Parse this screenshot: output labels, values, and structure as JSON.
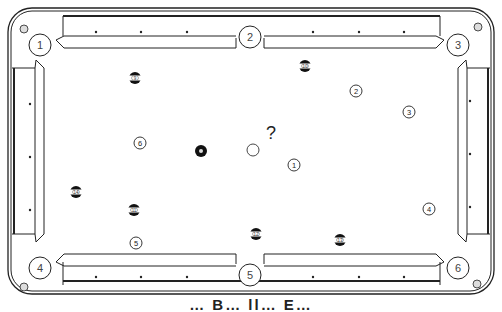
{
  "diagram": {
    "title_partial": "… B… ll… E…",
    "question_mark": "?",
    "pockets": [
      {
        "label": "1",
        "x": 40,
        "y": 45
      },
      {
        "label": "2",
        "x": 250,
        "y": 37
      },
      {
        "label": "3",
        "x": 458,
        "y": 45
      },
      {
        "label": "4",
        "x": 40,
        "y": 268
      },
      {
        "label": "5",
        "x": 250,
        "y": 275
      },
      {
        "label": "6",
        "x": 458,
        "y": 268
      }
    ],
    "solid_balls": [
      {
        "label": "1",
        "x": 294,
        "y": 165
      },
      {
        "label": "2",
        "x": 356,
        "y": 91
      },
      {
        "label": "3",
        "x": 409,
        "y": 112
      },
      {
        "label": "4",
        "x": 429,
        "y": 209
      },
      {
        "label": "5",
        "x": 136,
        "y": 243
      },
      {
        "label": "6",
        "x": 140,
        "y": 143
      }
    ],
    "striped_balls": [
      {
        "label": "9",
        "x": 135,
        "y": 78
      },
      {
        "label": "10",
        "x": 305,
        "y": 66
      },
      {
        "label": "14",
        "x": 76,
        "y": 192
      },
      {
        "label": "11",
        "x": 134,
        "y": 210
      },
      {
        "label": "12",
        "x": 256,
        "y": 234
      },
      {
        "label": "13",
        "x": 340,
        "y": 240
      }
    ],
    "eight_ball": {
      "label": "8",
      "x": 201,
      "y": 151
    },
    "cue_ball": {
      "x": 253,
      "y": 150
    },
    "question": {
      "x": 271,
      "y": 133
    },
    "colors": {
      "line": "#222222",
      "background": "#ffffff",
      "ball_dark": "#111111"
    }
  }
}
